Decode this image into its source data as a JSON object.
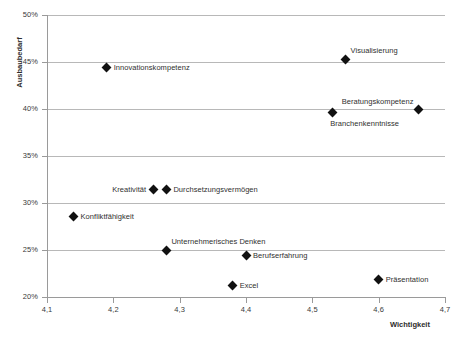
{
  "chart_data": {
    "type": "scatter",
    "title": "",
    "xlabel": "Wichtigkeit",
    "ylabel": "Ausbaubedarf",
    "xlim": [
      4.1,
      4.7
    ],
    "ylim": [
      20,
      50
    ],
    "grid": "horizontal",
    "legend": "none",
    "x_tick_labels": [
      "4,1",
      "4,2",
      "4,3",
      "4,4",
      "4,5",
      "4,6",
      "4,7"
    ],
    "x_tick_values": [
      4.1,
      4.2,
      4.3,
      4.4,
      4.5,
      4.6,
      4.7
    ],
    "y_tick_labels": [
      "50%",
      "45%",
      "40%",
      "35%",
      "30%",
      "25%",
      "20%"
    ],
    "y_tick_values": [
      50,
      45,
      40,
      35,
      30,
      25,
      20
    ],
    "points": [
      {
        "label": "Visualisierung",
        "x": 4.55,
        "y": 45.3,
        "label_pos": "lbl-above-right"
      },
      {
        "label": "Innovationskompetenz",
        "x": 4.19,
        "y": 44.4,
        "label_pos": "lbl-right"
      },
      {
        "label": "Beratungskompetenz",
        "x": 4.66,
        "y": 39.9,
        "label_pos": "lbl-above-left"
      },
      {
        "label": "Branchenkenntnisse",
        "x": 4.53,
        "y": 39.6,
        "label_pos": "lbl-below"
      },
      {
        "label": "Kreativität",
        "x": 4.26,
        "y": 31.4,
        "label_pos": "lbl-left"
      },
      {
        "label": "Durchsetzungsvermögen",
        "x": 4.28,
        "y": 31.4,
        "label_pos": "lbl-right"
      },
      {
        "label": "Konfliktfähigkeit",
        "x": 4.14,
        "y": 28.6,
        "label_pos": "lbl-right"
      },
      {
        "label": "Unternehmerisches Denken",
        "x": 4.28,
        "y": 25.0,
        "label_pos": "lbl-above-right"
      },
      {
        "label": "Berufserfahrung",
        "x": 4.4,
        "y": 24.4,
        "label_pos": "lbl-right"
      },
      {
        "label": "Präsentation",
        "x": 4.6,
        "y": 21.9,
        "label_pos": "lbl-right"
      },
      {
        "label": "Excel",
        "x": 4.38,
        "y": 21.2,
        "label_pos": "lbl-right"
      }
    ],
    "colors": {
      "marker": "#111111",
      "gridline": "#b8b8b8",
      "axis": "#9a9a9a",
      "text": "#2f2f2f",
      "background": "#ffffff"
    }
  }
}
